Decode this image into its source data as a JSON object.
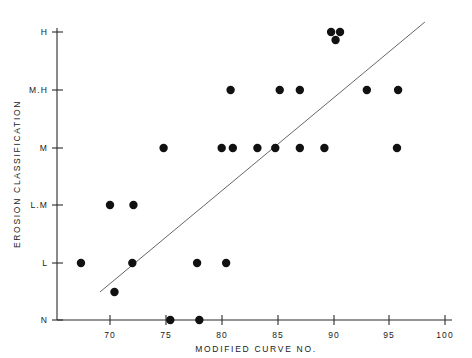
{
  "chart_data": {
    "type": "scatter",
    "title": "",
    "xlabel": "MODIFIED CURVE NO.",
    "ylabel": "EROSION CLASSIFICATION",
    "xlim": [
      67,
      100
    ],
    "xticks": [
      70,
      75,
      80,
      85,
      90,
      95,
      100
    ],
    "xticklabels": [
      "70",
      "75",
      "80",
      "85",
      "90",
      "95",
      "100"
    ],
    "ycategories": [
      "N",
      "L",
      "L.M",
      "M",
      "M.H",
      "H"
    ],
    "yticklabels": [
      "N",
      "L",
      "L.M",
      "M",
      "M.H",
      "H"
    ],
    "ylabel_order": "bottom-to-top",
    "grid": false,
    "legend": false,
    "points": [
      {
        "x": 75.4,
        "y": "N"
      },
      {
        "x": 78.0,
        "y": "N"
      },
      {
        "x": 67.4,
        "y": "L"
      },
      {
        "x": 72.0,
        "y": "L"
      },
      {
        "x": 77.8,
        "y": "L"
      },
      {
        "x": 80.4,
        "y": "L"
      },
      {
        "x": 70.4,
        "y": "L-minus"
      },
      {
        "x": 70.0,
        "y": "L.M"
      },
      {
        "x": 72.1,
        "y": "L.M"
      },
      {
        "x": 74.8,
        "y": "M"
      },
      {
        "x": 80.0,
        "y": "M"
      },
      {
        "x": 81.0,
        "y": "M"
      },
      {
        "x": 83.2,
        "y": "M"
      },
      {
        "x": 84.8,
        "y": "M"
      },
      {
        "x": 87.0,
        "y": "M"
      },
      {
        "x": 89.2,
        "y": "M"
      },
      {
        "x": 95.7,
        "y": "M"
      },
      {
        "x": 80.8,
        "y": "M.H"
      },
      {
        "x": 85.2,
        "y": "M.H"
      },
      {
        "x": 87.0,
        "y": "M.H"
      },
      {
        "x": 93.0,
        "y": "M.H"
      },
      {
        "x": 95.8,
        "y": "M.H"
      },
      {
        "x": 89.8,
        "y": "H"
      },
      {
        "x": 90.6,
        "y": "H"
      },
      {
        "x": 90.2,
        "y": "H-lower"
      }
    ],
    "trendline": {
      "x_start": 69.1,
      "y_start_px": 292,
      "x_end": 98.2,
      "y_end_px": 22
    },
    "point_count": 25,
    "marker_radius_px": 4.2,
    "colors": {
      "marker": "#111111",
      "axis": "#2b2b2b",
      "trendline": "#555555",
      "background": "#ffffff"
    }
  },
  "geometry": {
    "x_px_70": 110,
    "x_px_100": 445,
    "y_px": {
      "H": 32,
      "M.H": 90,
      "M": 148,
      "L.M": 205,
      "L": 263,
      "N": 320,
      "L-minus": 292,
      "H-lower": 40
    },
    "axis_left_px": 57,
    "axis_bottom_px": 320,
    "axis_top_px": 28,
    "axis_right_px": 452
  }
}
